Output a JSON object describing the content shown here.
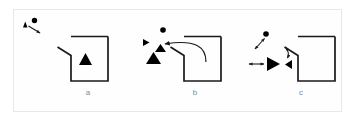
{
  "figure": {
    "type": "diagram",
    "frame": {
      "stroke_color": "#e8e8e8",
      "background": "#fefefe",
      "x": 13,
      "y": 9,
      "width": 329,
      "height": 103
    },
    "stroke_color": "#1a1a1a",
    "fill_color": "#000000",
    "label_color": "#8a8a8a",
    "panels": [
      {
        "id": "a",
        "label": "a",
        "label_position": {
          "x": 88,
          "y": 93
        },
        "elements": [
          {
            "name": "legend-triangle",
            "kind": "filled-triangle",
            "x": 23,
            "y": 23,
            "size": 5,
            "rotation": 0
          },
          {
            "name": "legend-dot",
            "kind": "filled-circle",
            "x": 34,
            "y": 20,
            "radius": 2.6
          },
          {
            "name": "legend-arrow",
            "kind": "arrow",
            "from": {
              "x": 27,
              "y": 25
            },
            "to": {
              "x": 41,
              "y": 33
            }
          },
          {
            "name": "enclosure",
            "kind": "c-shape-with-flap",
            "x": 58,
            "y": 36,
            "width": 48,
            "height": 45
          },
          {
            "name": "agent-triangle",
            "kind": "filled-triangle",
            "x": 85,
            "y": 58,
            "size": 10,
            "rotation": 0
          }
        ]
      },
      {
        "id": "b",
        "label": "b",
        "label_position": {
          "x": 195,
          "y": 93
        },
        "elements": [
          {
            "name": "goal-dot",
            "kind": "filled-circle",
            "x": 163,
            "y": 30,
            "radius": 2.8
          },
          {
            "name": "heading-marker",
            "kind": "filled-triangle",
            "x": 146,
            "y": 42,
            "size": 5,
            "rotation": 90
          },
          {
            "name": "mid-triangle",
            "kind": "filled-triangle",
            "x": 161,
            "y": 49,
            "size": 6,
            "rotation": 0
          },
          {
            "name": "agent-triangle",
            "kind": "filled-triangle",
            "x": 153,
            "y": 58,
            "size": 10,
            "rotation": 0
          },
          {
            "name": "curved-escape-arrow",
            "kind": "curved-arrow",
            "from": {
              "x": 204,
              "y": 62
            },
            "to": {
              "x": 164,
              "y": 50
            }
          },
          {
            "name": "enclosure",
            "kind": "c-shape-with-flap",
            "x": 172,
            "y": 36,
            "width": 48,
            "height": 45
          }
        ]
      },
      {
        "id": "c",
        "label": "c",
        "label_position": {
          "x": 301,
          "y": 93
        },
        "elements": [
          {
            "name": "goal-dot",
            "kind": "filled-circle",
            "x": 266,
            "y": 34,
            "radius": 2.8
          },
          {
            "name": "double-arrow-diagonal",
            "kind": "double-arrow",
            "from": {
              "x": 256,
              "y": 48
            },
            "to": {
              "x": 266,
              "y": 38
            }
          },
          {
            "name": "double-arrow-horizontal",
            "kind": "double-arrow",
            "from": {
              "x": 249,
              "y": 64
            },
            "to": {
              "x": 263,
              "y": 64
            }
          },
          {
            "name": "agent-triangle",
            "kind": "filled-triangle",
            "x": 272,
            "y": 64,
            "size": 10,
            "rotation": 90
          },
          {
            "name": "target-triangle",
            "kind": "filled-triangle",
            "x": 288,
            "y": 64,
            "size": 6,
            "rotation": 270
          },
          {
            "name": "double-arrow-vertical",
            "kind": "double-arrow",
            "from": {
              "x": 285,
              "y": 47
            },
            "to": {
              "x": 288,
              "y": 58
            }
          },
          {
            "name": "enclosure",
            "kind": "c-shape-with-flap",
            "x": 286,
            "y": 36,
            "width": 48,
            "height": 45
          }
        ]
      }
    ]
  }
}
